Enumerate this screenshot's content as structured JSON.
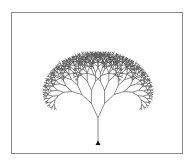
{
  "figure": {
    "type": "fractal-tree",
    "frame_color": "#8a8a8a",
    "line_color": "#555555",
    "background": "#ffffff"
  },
  "tree": {
    "base": [
      98,
      144
    ],
    "trunk_length": 26,
    "depth": 9,
    "branch_angle_deg": 24,
    "length_ratio": 0.8,
    "turtle_marker": "triangle"
  }
}
